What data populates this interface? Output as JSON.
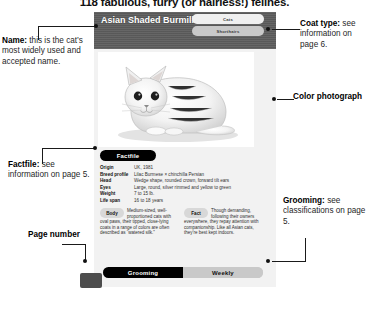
{
  "headline": "118 fabulous, furry (or hairless!) felines.",
  "card": {
    "breed_name": "Asian Shaded Burmilla",
    "tabs": [
      {
        "label": "Cats",
        "state": "light"
      },
      {
        "label": "Shorthairs",
        "state": "grey"
      }
    ],
    "photo": {
      "icon": "cat-photograph",
      "description": "Silver shaded shorthair cat lying down, facing left"
    },
    "factfile": {
      "title": "Factfile",
      "rows": [
        {
          "key": "Origin",
          "value": "UK, 1981"
        },
        {
          "key": "Breed profile",
          "value": "Lilac Burmese × chinchilla Persian"
        },
        {
          "key": "Head",
          "value": "Wedge shape, rounded crown, forward tilt ears"
        },
        {
          "key": "Eyes",
          "value": "Large, round, silver rimmed and yellow to green"
        },
        {
          "key": "Weight",
          "value": "7 to 15 lb."
        },
        {
          "key": "Life span",
          "value": "16 to 18 years"
        }
      ],
      "blurbs": [
        {
          "pill": "Body",
          "text": "Medium-sized, well-proportioned cats with oval paws, their tipped, close-lying coats in a range of colors are often described as “watered silk.”"
        },
        {
          "pill": "Fact",
          "text": "Though demanding, following their owners everywhere, they repay attention with companionship. Like all Asian cats, they’re best kept indoors."
        }
      ]
    },
    "bottom_nav": [
      {
        "label": "Grooming",
        "state": "active"
      },
      {
        "label": "Weekly",
        "state": "inactive"
      }
    ]
  },
  "annotations": {
    "name": {
      "title": "Name:",
      "text": "this is the cat’s most widely used and accepted name."
    },
    "factfile": {
      "title": "Factfile:",
      "text": "see information on page 5."
    },
    "page": {
      "title": "Page number",
      "text": ""
    },
    "coat": {
      "title": "Coat type:",
      "text": "see information on page 6."
    },
    "color": {
      "title": "Color photograph",
      "text": ""
    },
    "grooming": {
      "title": "Grooming:",
      "text": " see classifications on page 5."
    }
  },
  "colors": {
    "header_grey": "#5e5e5e",
    "card_bg": "#f2f2f2",
    "active_black": "#000000",
    "inactive_grey": "#c9c9c9",
    "page_block": "#4d4d4d"
  }
}
